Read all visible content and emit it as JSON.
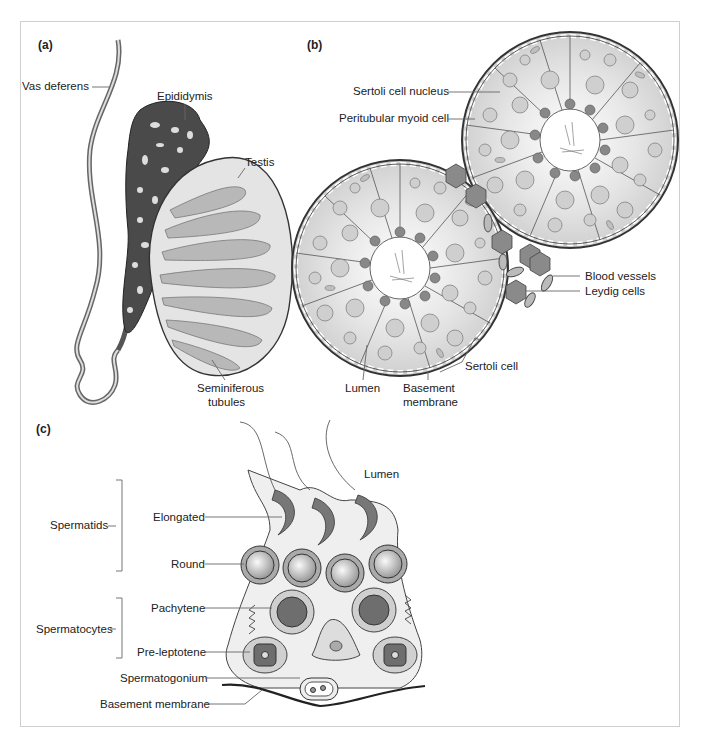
{
  "figure": {
    "panels": [
      {
        "id": "a",
        "label": "(a)",
        "labels": {
          "vas_deferens": "Vas deferens",
          "epididymis": "Epididymis",
          "testis": "Testis",
          "seminiferous_line1": "Seminiferous",
          "seminiferous_line2": "tubules"
        }
      },
      {
        "id": "b",
        "label": "(b)",
        "labels": {
          "sertoli_nucleus": "Sertoli cell nucleus",
          "peritubular": "Peritubular myoid cell",
          "blood_vessels": "Blood vessels",
          "leydig": "Leydig cells",
          "sertoli_cell": "Sertoli cell",
          "lumen": "Lumen",
          "basement_line1": "Basement",
          "basement_line2": "membrane"
        }
      },
      {
        "id": "c",
        "label": "(c)",
        "labels": {
          "lumen": "Lumen",
          "spermatids": "Spermatids",
          "elongated": "Elongated",
          "round": "Round",
          "spermatocytes": "Spermatocytes",
          "pachytene": "Pachytene",
          "pre_leptotene": "Pre-leptotene",
          "spermatogonium": "Spermatogonium",
          "basement_membrane": "Basement membrane"
        }
      }
    ],
    "colors": {
      "border": "#cfcfcf",
      "dark_tissue": "#4a4a4a",
      "mid_tissue": "#8a8a8a",
      "light_tissue": "#d8d8d8",
      "cell_fill": "#bdbdbd",
      "background": "#ffffff"
    }
  }
}
